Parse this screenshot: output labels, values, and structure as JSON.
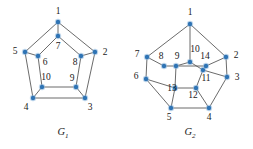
{
  "figure": {
    "background_color": "#ffffff",
    "vertex_color": "#2f74b5",
    "edge_color": "#5a5a5a",
    "label_color": "#1a1a1a",
    "width": 253,
    "height": 149
  },
  "graphs": [
    {
      "id": "G1",
      "caption_main": "G",
      "caption_sub": "1",
      "caption_x": 63,
      "caption_y": 135,
      "vertices": [
        {
          "label": "1",
          "x": 58,
          "y": 22,
          "lx": 58,
          "ly": 12
        },
        {
          "label": "2",
          "x": 95,
          "y": 52,
          "lx": 105,
          "ly": 53
        },
        {
          "label": "3",
          "x": 85,
          "y": 98,
          "lx": 90,
          "ly": 108
        },
        {
          "label": "4",
          "x": 33,
          "y": 98,
          "lx": 26,
          "ly": 108
        },
        {
          "label": "5",
          "x": 25,
          "y": 52,
          "lx": 15,
          "ly": 52
        },
        {
          "label": "6",
          "x": 38,
          "y": 56,
          "lx": 45,
          "ly": 63
        },
        {
          "label": "7",
          "x": 58,
          "y": 36,
          "lx": 58,
          "ly": 47
        },
        {
          "label": "8",
          "x": 81,
          "y": 56,
          "lx": 75,
          "ly": 63
        },
        {
          "label": "9",
          "x": 76,
          "y": 87,
          "lx": 72,
          "ly": 79
        },
        {
          "label": "10",
          "x": 42,
          "y": 87,
          "lx": 46,
          "ly": 78
        }
      ],
      "edges": [
        [
          "1",
          "5"
        ],
        [
          "1",
          "2"
        ],
        [
          "2",
          "3"
        ],
        [
          "3",
          "4"
        ],
        [
          "4",
          "5"
        ],
        [
          "1",
          "7"
        ],
        [
          "2",
          "8"
        ],
        [
          "3",
          "9"
        ],
        [
          "4",
          "10"
        ],
        [
          "5",
          "6"
        ],
        [
          "6",
          "7"
        ],
        [
          "7",
          "8"
        ],
        [
          "8",
          "9"
        ],
        [
          "9",
          "10"
        ],
        [
          "10",
          "6"
        ]
      ]
    },
    {
      "id": "G2",
      "caption_main": "G",
      "caption_sub": "2",
      "caption_x": 190,
      "caption_y": 135,
      "vertices": [
        {
          "label": "1",
          "x": 190,
          "y": 24,
          "lx": 190,
          "ly": 13
        },
        {
          "label": "2",
          "x": 226,
          "y": 57,
          "lx": 236,
          "ly": 56
        },
        {
          "label": "3",
          "x": 227,
          "y": 77,
          "lx": 237,
          "ly": 78
        },
        {
          "label": "4",
          "x": 209,
          "y": 108,
          "lx": 209,
          "ly": 118
        },
        {
          "label": "5",
          "x": 171,
          "y": 108,
          "lx": 169,
          "ly": 118
        },
        {
          "label": "6",
          "x": 146,
          "y": 79,
          "lx": 136,
          "ly": 77
        },
        {
          "label": "7",
          "x": 147,
          "y": 57,
          "lx": 137,
          "ly": 55
        },
        {
          "label": "8",
          "x": 164,
          "y": 66,
          "lx": 161,
          "ly": 57
        },
        {
          "label": "9",
          "x": 176,
          "y": 66,
          "lx": 177,
          "ly": 57
        },
        {
          "label": "10",
          "x": 190,
          "y": 62,
          "lx": 195,
          "ly": 50
        },
        {
          "label": "11",
          "x": 203,
          "y": 70,
          "lx": 206,
          "ly": 79
        },
        {
          "label": "12",
          "x": 196,
          "y": 88,
          "lx": 193,
          "ly": 96
        },
        {
          "label": "13",
          "x": 175,
          "y": 88,
          "lx": 172,
          "ly": 89
        },
        {
          "label": "14",
          "x": 206,
          "y": 66,
          "lx": 205,
          "ly": 57
        }
      ],
      "edges": [
        [
          "1",
          "7"
        ],
        [
          "1",
          "2"
        ],
        [
          "7",
          "6"
        ],
        [
          "6",
          "5"
        ],
        [
          "5",
          "4"
        ],
        [
          "4",
          "3"
        ],
        [
          "3",
          "2"
        ],
        [
          "1",
          "10"
        ],
        [
          "7",
          "8"
        ],
        [
          "6",
          "13"
        ],
        [
          "2",
          "14"
        ],
        [
          "3",
          "11"
        ],
        [
          "5",
          "13"
        ],
        [
          "4",
          "12"
        ],
        [
          "8",
          "9"
        ],
        [
          "9",
          "10"
        ],
        [
          "10",
          "11"
        ],
        [
          "11",
          "12"
        ],
        [
          "12",
          "13"
        ],
        [
          "13",
          "9"
        ],
        [
          "11",
          "14"
        ],
        [
          "14",
          "9"
        ]
      ]
    }
  ]
}
